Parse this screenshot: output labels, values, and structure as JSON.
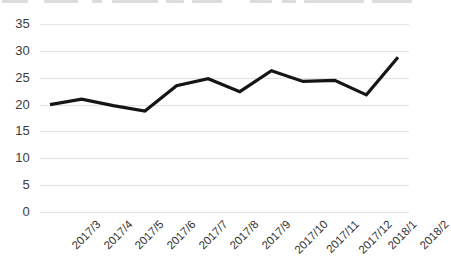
{
  "chart_data": {
    "type": "line",
    "title": "",
    "xlabel": "",
    "ylabel": "",
    "categories": [
      "2017/3",
      "2017/4",
      "2017/5",
      "2017/6",
      "2017/7",
      "2017/8",
      "2017/9",
      "2017/10",
      "2017/11",
      "2017/12",
      "2018/1",
      "2018/2"
    ],
    "values": [
      20,
      21,
      19.8,
      18.8,
      23.5,
      24.8,
      22.4,
      26.3,
      24.3,
      24.5,
      21.8,
      28.8
    ],
    "ylim": [
      0,
      35
    ],
    "ytick_labels": [
      "35",
      "30",
      "25",
      "20",
      "15",
      "10",
      "5",
      "0"
    ],
    "ytick_values": [
      35,
      30,
      25,
      20,
      15,
      10,
      5,
      0
    ],
    "grid": true,
    "legend": false,
    "series_color": "#151515",
    "grid_color": "#e2e2e4",
    "tick_color": "#3b3b3b"
  }
}
